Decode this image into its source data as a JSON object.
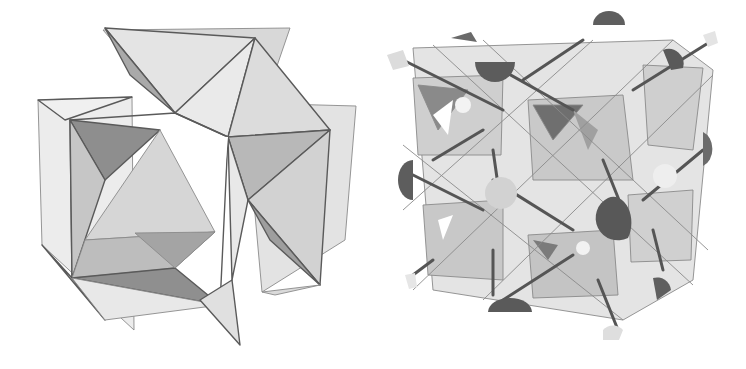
{
  "figure": {
    "background": "#ffffff",
    "panels": [
      {
        "id": "left",
        "description": "Single unit cell of corner-sharing octahedral framework (cubic perovskite-like cage)",
        "tones": {
          "light": "#e6e6e6",
          "mid": "#c4c4c4",
          "dark": "#8c8c8c",
          "edge": "#5a5a5a"
        }
      },
      {
        "id": "right",
        "description": "2x2x2 supercell of octahedral framework with cations (half-spheres) on rods",
        "tones": {
          "light": "#e2e2e2",
          "mid": "#bdbdbd",
          "dark": "#6e6e6e",
          "sphere_dark": "#5c5c5c",
          "sphere_light": "#d4d4d4"
        }
      }
    ]
  }
}
